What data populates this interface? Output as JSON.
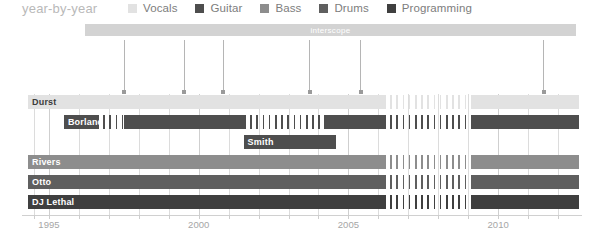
{
  "header": {
    "title": "year-by-year"
  },
  "legend": {
    "items": [
      {
        "label": "Vocals",
        "color": "#e2e2e2"
      },
      {
        "label": "Guitar",
        "color": "#4e4e4e"
      },
      {
        "label": "Bass",
        "color": "#8d8d8d"
      },
      {
        "label": "Drums",
        "color": "#5f5f5f"
      },
      {
        "label": "Programming",
        "color": "#3f3f3f"
      }
    ]
  },
  "label_bar": {
    "items": [
      {
        "name": "interscope",
        "start": 1996.2,
        "end": 2012.6,
        "color": "#d3d3d3"
      }
    ]
  },
  "chart_data": {
    "type": "bar",
    "title": "year-by-year",
    "xlabel": "",
    "ylabel": "",
    "xlim": [
      1994.1,
      2012.8
    ],
    "grid": true,
    "legend_position": "top",
    "tick_labels": [
      "1995",
      "2000",
      "2005",
      "2010"
    ],
    "tick_values": [
      1995,
      2000,
      2005,
      2010
    ],
    "minor_tick_values": [
      1994.5,
      1996,
      1997,
      1998,
      1999,
      2001,
      2002,
      2003,
      2004,
      2006,
      2007,
      2008,
      2009,
      2011,
      2012
    ],
    "roles": [
      "Vocals",
      "Guitar",
      "Bass",
      "Drums",
      "Programming"
    ],
    "members": [
      {
        "name": "Durst",
        "role": "Vocals",
        "color": "#e2e2e2",
        "label_color": "dark",
        "segments": [
          {
            "start": 1994.3,
            "end": 2006.2,
            "style": "solid"
          },
          {
            "start": 2006.2,
            "end": 2009.1,
            "style": "hatched"
          },
          {
            "start": 2009.1,
            "end": 2012.7,
            "style": "solid"
          }
        ]
      },
      {
        "name": "Borland",
        "role": "Guitar",
        "color": "#4e4e4e",
        "label_color": "light",
        "segments": [
          {
            "start": 1995.5,
            "end": 1996.6,
            "style": "solid"
          },
          {
            "start": 1996.6,
            "end": 1997.5,
            "style": "hatched"
          },
          {
            "start": 1997.5,
            "end": 2001.5,
            "style": "solid"
          },
          {
            "start": 2001.5,
            "end": 2004.2,
            "style": "hatched"
          },
          {
            "start": 2004.2,
            "end": 2006.2,
            "style": "solid"
          },
          {
            "start": 2006.2,
            "end": 2009.1,
            "style": "hatched"
          },
          {
            "start": 2009.1,
            "end": 2012.7,
            "style": "solid"
          }
        ]
      },
      {
        "name": "Smith",
        "role": "Guitar",
        "color": "#4e4e4e",
        "label_color": "light",
        "segments": [
          {
            "start": 2001.5,
            "end": 2004.6,
            "style": "solid"
          }
        ]
      },
      {
        "name": "Rivers",
        "role": "Bass",
        "color": "#8d8d8d",
        "label_color": "light",
        "segments": [
          {
            "start": 1994.3,
            "end": 2006.2,
            "style": "solid"
          },
          {
            "start": 2006.2,
            "end": 2009.1,
            "style": "hatched"
          },
          {
            "start": 2009.1,
            "end": 2012.7,
            "style": "solid"
          }
        ]
      },
      {
        "name": "Otto",
        "role": "Drums",
        "color": "#5f5f5f",
        "label_color": "light",
        "segments": [
          {
            "start": 1994.3,
            "end": 2006.2,
            "style": "solid"
          },
          {
            "start": 2006.2,
            "end": 2009.1,
            "style": "hatched"
          },
          {
            "start": 2009.1,
            "end": 2012.7,
            "style": "solid"
          }
        ]
      },
      {
        "name": "DJ Lethal",
        "role": "Programming",
        "color": "#3f3f3f",
        "label_color": "light",
        "segments": [
          {
            "start": 1994.3,
            "end": 2006.2,
            "style": "solid"
          },
          {
            "start": 2006.2,
            "end": 2009.1,
            "style": "hatched"
          },
          {
            "start": 2009.1,
            "end": 2012.7,
            "style": "solid"
          }
        ]
      }
    ],
    "albums": [
      {
        "title": "Three Dollar Bill, Y'all$",
        "year": 1997.5
      },
      {
        "title": "Significant Other",
        "year": 1999.5
      },
      {
        "title": "Chocolate Starfish and the Hot Dog Flavored Water",
        "year": 2000.8
      },
      {
        "title": "Results May Vary",
        "year": 2003.7
      },
      {
        "title": "The Unquestionable Truth (Part 1)",
        "year": 2005.4
      },
      {
        "title": "Gold Cobra",
        "year": 2011.5
      }
    ]
  }
}
